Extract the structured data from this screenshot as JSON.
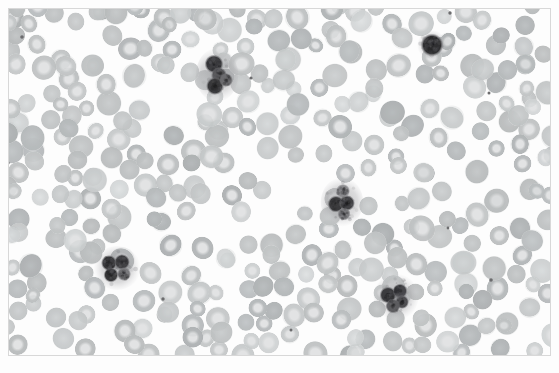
{
  "image": {
    "kind": "micrograph",
    "subject": "peripheral blood smear",
    "width": 559,
    "height": 373,
    "background_color": "#ffffff",
    "frame": {
      "color": "#d8d8d8",
      "left": 8,
      "top": 8,
      "width": 543,
      "height": 348,
      "thickness": 1
    },
    "field_color": "#fdfdfd"
  },
  "palette": {
    "background": "#ffffff",
    "rbc_fill": "#c9cbcc",
    "rbc_fill_light": "#d6d8d9",
    "rbc_fill_dark": "#b9bcbe",
    "rbc_pallor": "#ededee",
    "rbc_edge": "#b4b7b9",
    "wbc_nucleus_dark": "#3a3a3c",
    "wbc_nucleus_mid": "#545457",
    "wbc_cytoplasm": "#a9a9ab",
    "platelet": "#6c6c6e"
  },
  "cells": {
    "rbc_count": 372,
    "rbc_radius_min": 8.0,
    "rbc_radius_max": 13.0,
    "pallor_fraction": 0.42,
    "platelet_count": 9
  },
  "white_blood_cells": [
    {
      "id": "wbc-1",
      "label": "neutrophil",
      "cx": 217,
      "cy": 75,
      "rx": 17,
      "ry": 22,
      "lobes": [
        {
          "dx": -3,
          "dy": -11,
          "r": 9.5,
          "shade": "#3d3d40"
        },
        {
          "dx": 2,
          "dy": 0,
          "r": 8.0,
          "shade": "#58585b"
        },
        {
          "dx": -2,
          "dy": 11,
          "r": 9.0,
          "shade": "#39393b"
        },
        {
          "dx": 9,
          "dy": 5,
          "r": 7.0,
          "shade": "#6b6b6e"
        }
      ]
    },
    {
      "id": "wbc-2",
      "label": "lymphocyte",
      "cx": 432,
      "cy": 45,
      "rx": 12,
      "ry": 12,
      "lobes": [
        {
          "dx": 0,
          "dy": 0,
          "r": 11.5,
          "shade": "#2f2f31"
        }
      ]
    },
    {
      "id": "wbc-3",
      "label": "segmented-neutrophil",
      "cx": 342,
      "cy": 202,
      "rx": 17,
      "ry": 20,
      "lobes": [
        {
          "dx": -6,
          "dy": 2,
          "r": 8.5,
          "shade": "#3a3a3c"
        },
        {
          "dx": 5,
          "dy": 1,
          "r": 8.0,
          "shade": "#414144"
        },
        {
          "dx": 1,
          "dy": -11,
          "r": 7.0,
          "shade": "#8a8a8d"
        },
        {
          "dx": 2,
          "dy": 12,
          "r": 6.5,
          "shade": "#7d7d80"
        }
      ]
    },
    {
      "id": "wbc-4",
      "label": "multilobed-neutrophil",
      "cx": 117,
      "cy": 268,
      "rx": 19,
      "ry": 18,
      "lobes": [
        {
          "dx": -8,
          "dy": -5,
          "r": 8.0,
          "shade": "#3c3c3f"
        },
        {
          "dx": 5,
          "dy": -6,
          "r": 8.0,
          "shade": "#424245"
        },
        {
          "dx": -6,
          "dy": 7,
          "r": 7.5,
          "shade": "#38383a"
        },
        {
          "dx": 7,
          "dy": 6,
          "r": 7.0,
          "shade": "#7a7a7d"
        }
      ]
    },
    {
      "id": "wbc-5",
      "label": "neutrophil",
      "cx": 396,
      "cy": 297,
      "rx": 18,
      "ry": 19,
      "lobes": [
        {
          "dx": -8,
          "dy": -2,
          "r": 8.5,
          "shade": "#3b3b3e"
        },
        {
          "dx": 4,
          "dy": -6,
          "r": 7.5,
          "shade": "#46464a"
        },
        {
          "dx": 6,
          "dy": 5,
          "r": 7.0,
          "shade": "#4e4e51"
        },
        {
          "dx": -3,
          "dy": 9,
          "r": 7.5,
          "shade": "#5c5c5f"
        }
      ]
    }
  ],
  "platelets": [
    {
      "cx": 22,
      "cy": 37,
      "r": 1.8
    },
    {
      "cx": 251,
      "cy": 78,
      "r": 1.6
    },
    {
      "cx": 450,
      "cy": 13,
      "r": 1.7
    },
    {
      "cx": 489,
      "cy": 93,
      "r": 1.5
    },
    {
      "cx": 491,
      "cy": 280,
      "r": 1.8
    },
    {
      "cx": 163,
      "cy": 299,
      "r": 1.7
    },
    {
      "cx": 448,
      "cy": 228,
      "r": 1.4
    },
    {
      "cx": 8,
      "cy": 163,
      "r": 1.6
    },
    {
      "cx": 291,
      "cy": 330,
      "r": 1.5
    }
  ]
}
